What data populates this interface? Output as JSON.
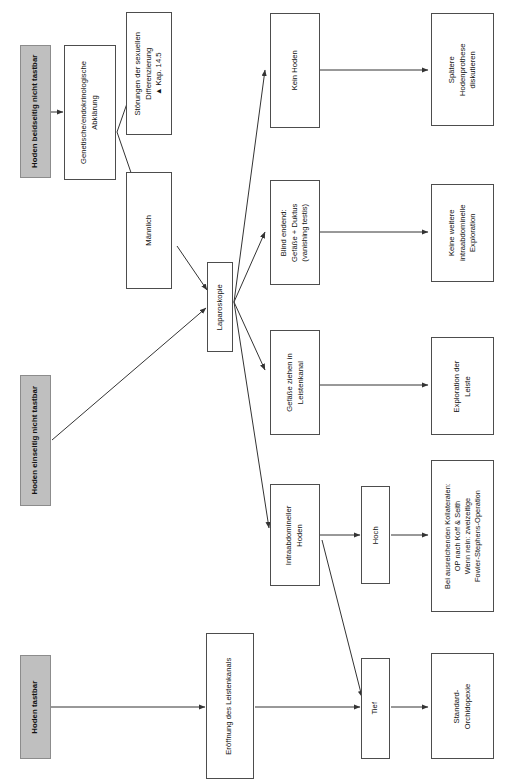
{
  "diagram": {
    "orientation": "rotated-90-ccw",
    "palette": {
      "entry_fill": "#bfbfbf",
      "node_fill": "#ffffff",
      "node_border": "#4d4d4d",
      "edge": "#333333"
    },
    "entries": [
      {
        "id": "e1",
        "label": "Hoden beidseitig nicht tastbar"
      },
      {
        "id": "e2",
        "label": "Hoden einseitig nicht tastbar"
      },
      {
        "id": "e3",
        "label": "Hoden tastbar"
      }
    ],
    "nodes": [
      {
        "id": "n1",
        "label": "Genetische/endokrinologische\nAbklärung"
      },
      {
        "id": "n2",
        "label": "Störungen der sexuellen\nDifferenzierung\n▲ Kap. 14.5"
      },
      {
        "id": "n3",
        "label": "Männlich"
      },
      {
        "id": "n4",
        "label": "Laparoskopie"
      },
      {
        "id": "n5",
        "label": "Kein Hoden"
      },
      {
        "id": "n6",
        "label": "Blind endend:\nGefäße + Duktus\n(vanishing testis)"
      },
      {
        "id": "n7",
        "label": "Gefäße ziehen in\nLeistenkanal"
      },
      {
        "id": "n8",
        "label": "Intraabdomineller\nHoden"
      },
      {
        "id": "n9",
        "label": "Hoch"
      },
      {
        "id": "n10",
        "label": "Tief"
      },
      {
        "id": "n11",
        "label": "Spätere\nHodenprothese\ndiskutieren"
      },
      {
        "id": "n12",
        "label": "Keine weitere\nintraabdominelle\nExploration"
      },
      {
        "id": "n13",
        "label": "Exploration der\nLeiste"
      },
      {
        "id": "n14",
        "label": "Bei ausreichenden Kollateralen:\nOP nach Koff & Seith\nWenn nein: zweizeitige\nFowler-Stephens-Operation"
      },
      {
        "id": "n15",
        "label": "Standard-\nOrchidopexie"
      },
      {
        "id": "n16",
        "label": "Eröffnung des Leistenkanals"
      }
    ],
    "edges": [
      {
        "from": "e1",
        "to": "n1"
      },
      {
        "from": "n1",
        "to": "n2"
      },
      {
        "from": "n1",
        "to": "n3"
      },
      {
        "from": "n3",
        "to": "n4"
      },
      {
        "from": "e2",
        "to": "n4"
      },
      {
        "from": "n4",
        "to": "n5"
      },
      {
        "from": "n4",
        "to": "n6"
      },
      {
        "from": "n4",
        "to": "n7"
      },
      {
        "from": "n4",
        "to": "n8"
      },
      {
        "from": "n5",
        "to": "n11"
      },
      {
        "from": "n6",
        "to": "n12"
      },
      {
        "from": "n7",
        "to": "n13"
      },
      {
        "from": "n8",
        "to": "n9"
      },
      {
        "from": "n8",
        "to": "n10"
      },
      {
        "from": "n9",
        "to": "n14"
      },
      {
        "from": "n10",
        "to": "n15"
      },
      {
        "from": "e3",
        "to": "n16"
      },
      {
        "from": "n16",
        "to": "n10"
      }
    ]
  }
}
